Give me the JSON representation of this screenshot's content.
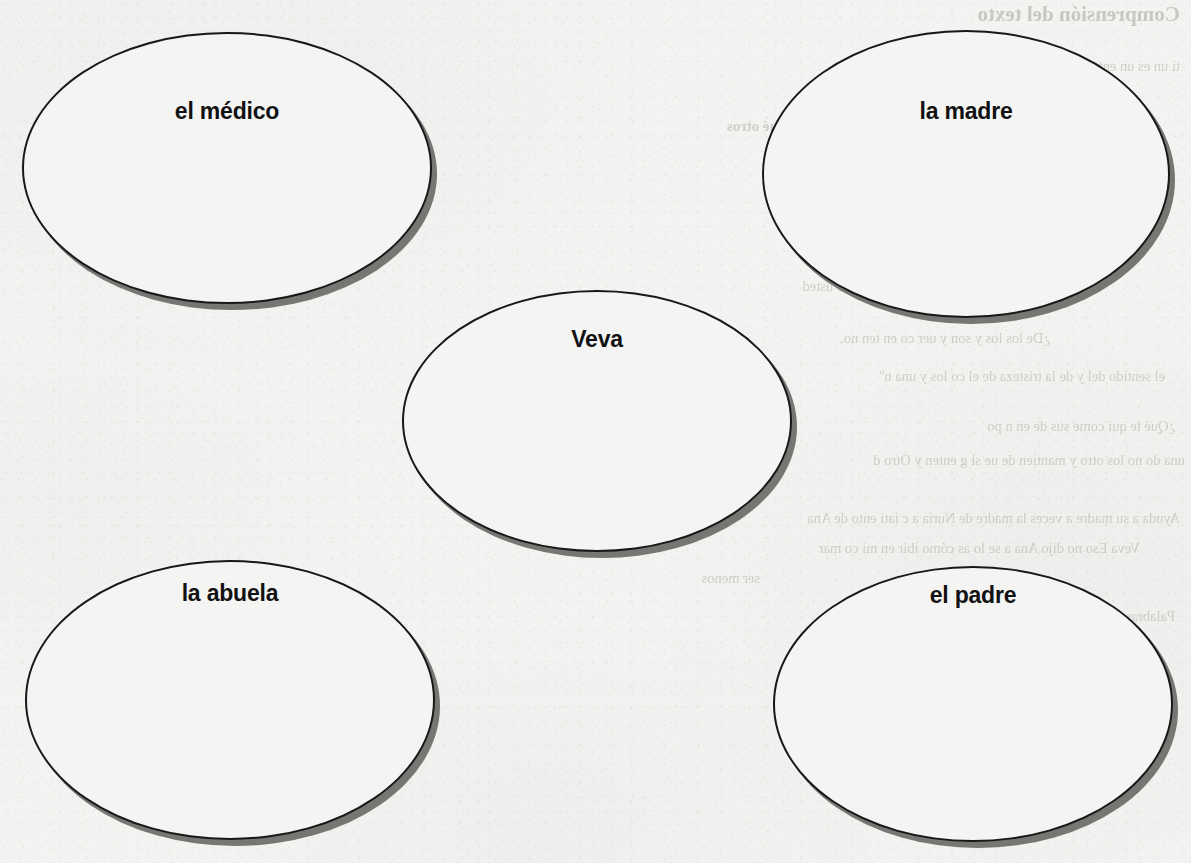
{
  "page": {
    "kind": "scanned-worksheet-page",
    "background_color": "#f3f3f1",
    "ink_color": "#18181a",
    "shadow_color": "#6f6f6c"
  },
  "diagram": {
    "type": "cluster-map",
    "center_node": "Veva",
    "nodes": [
      {
        "id": "medico",
        "label": "el médico",
        "x": 22,
        "y": 32,
        "w": 410,
        "h": 272,
        "label_top": 68
      },
      {
        "id": "madre",
        "label": "la madre",
        "x": 762,
        "y": 30,
        "w": 408,
        "h": 288,
        "label_top": 70
      },
      {
        "id": "veva",
        "label": "Veva",
        "x": 402,
        "y": 290,
        "w": 390,
        "h": 262,
        "label_top": 38
      },
      {
        "id": "abuela",
        "label": "la abuela",
        "x": 25,
        "y": 560,
        "w": 410,
        "h": 280,
        "label_top": 22
      },
      {
        "id": "padre",
        "label": "el padre",
        "x": 773,
        "y": 566,
        "w": 400,
        "h": 276,
        "label_top": 18
      }
    ]
  },
  "bleed_through": {
    "note": "Faint mirrored show-through text from the reverse side of the sheet; largely illegible in the scan.",
    "lines": [
      {
        "text": "Comprensión del texto",
        "x": 1180,
        "y": 2,
        "cls": "bleed-head"
      },
      {
        "text": "ti un    es un    enta una necesidad en       ona",
        "x": 1180,
        "y": 58,
        "cls": "bleed-body"
      },
      {
        "text": "e ad de  es que sientes",
        "x": 1120,
        "y": 84,
        "cls": "bleed-body"
      },
      {
        "text": "Personajes          ¿Quién es?  ¿Cómo actúa?  ¿Qué otros",
        "x": 1040,
        "y": 118,
        "cls": "bleed-sub"
      },
      {
        "text": "lo que nadie puede por que se enoja y dice que  e",
        "x": 1110,
        "y": 178,
        "cls": "bleed-body"
      },
      {
        "text": "e la tristeza  no se limita a lo que uno  me s  mes",
        "x": 1140,
        "y": 250,
        "cls": "bleed-body"
      },
      {
        "text": "ob     el eno e usted",
        "x": 900,
        "y": 278,
        "cls": "bleed-body"
      },
      {
        "text": "¿De   los  los      y  son  y uer  co  en  ten no.",
        "x": 1050,
        "y": 330,
        "cls": "bleed-body"
      },
      {
        "text": "el sentido del     y  de  la tristeza  de    el  co  los  y una  nº",
        "x": 1165,
        "y": 368,
        "cls": "bleed-body"
      },
      {
        "text": "¿Qué te          qui  come  sus  de                 en       n  po",
        "x": 1175,
        "y": 418,
        "cls": "bleed-body"
      },
      {
        "text": "una  do  no  los  otro  y  mantien  de  ue  si  g  enten   y  Otro  d",
        "x": 1185,
        "y": 452,
        "cls": "bleed-body"
      },
      {
        "text": "Ayuda  a  su  madre  a  veces  la  madre  de  Nuria  a  c  iati  ento  de  Ana",
        "x": 1180,
        "y": 510,
        "cls": "bleed-body"
      },
      {
        "text": "Veva  Eso  no  dijo  Ana  a  se  lo   as  cómo  ibir  en  mi  co  mar",
        "x": 1140,
        "y": 540,
        "cls": "bleed-body"
      },
      {
        "text": "ser  menos",
        "x": 760,
        "y": 570,
        "cls": "bleed-body"
      },
      {
        "text": "Palabras  se  liar  un  cosa  en  cierta  no  lo  abuela  conoc",
        "x": 1175,
        "y": 608,
        "cls": "bleed-body"
      }
    ]
  }
}
